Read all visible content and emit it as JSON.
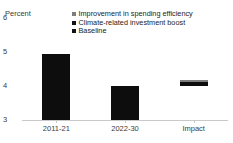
{
  "chart_data": {
    "type": "bar",
    "title": "Infrastructure",
    "ylabel": "Percent",
    "xlabel": "",
    "ylim": [
      3,
      6
    ],
    "yticks": [
      "3",
      "4",
      "5",
      "6"
    ],
    "grid": false,
    "legend_position": "top-right",
    "categories": [
      "2011-21",
      "2022-30",
      "Impact"
    ],
    "baseline_value": 3,
    "series": [
      {
        "name": "Baseline",
        "color": "#0d0d0d",
        "values": [
          4.95,
          4.0,
          null
        ]
      },
      {
        "name": "Climate-related investment boost",
        "color": "#0d0d0d",
        "values": [
          null,
          null,
          4.12
        ]
      },
      {
        "name": "Improvement in spending efficiency",
        "color": "#7d7d7d",
        "values": [
          null,
          null,
          4.18
        ]
      }
    ],
    "bars": [
      {
        "category": "2011-21",
        "bottom": 3.0,
        "top": 4.95,
        "segments": [
          {
            "name": "Baseline",
            "from": 3.0,
            "to": 4.95,
            "color": "#0d0d0d"
          }
        ]
      },
      {
        "category": "2022-30",
        "bottom": 3.0,
        "top": 4.0,
        "segments": [
          {
            "name": "Baseline",
            "from": 3.0,
            "to": 4.0,
            "color": "#0d0d0d"
          }
        ]
      },
      {
        "category": "Impact",
        "bottom": 4.0,
        "top": 4.18,
        "segments": [
          {
            "name": "Climate-related investment boost",
            "from": 4.0,
            "to": 4.12,
            "color": "#0d0d0d"
          },
          {
            "name": "Improvement in spending efficiency",
            "from": 4.12,
            "to": 4.18,
            "color": "#7d7d7d"
          }
        ]
      }
    ]
  },
  "legend": {
    "items": [
      {
        "label": "Improvement in spending efficiency",
        "color": "#7d7d7d"
      },
      {
        "label": "Climate-related investment boost",
        "color": "#121212"
      },
      {
        "label": "Baseline",
        "color": "#121212"
      }
    ]
  },
  "axis": {
    "unit_label": "Percent",
    "line_color": "#c9c9c9"
  }
}
